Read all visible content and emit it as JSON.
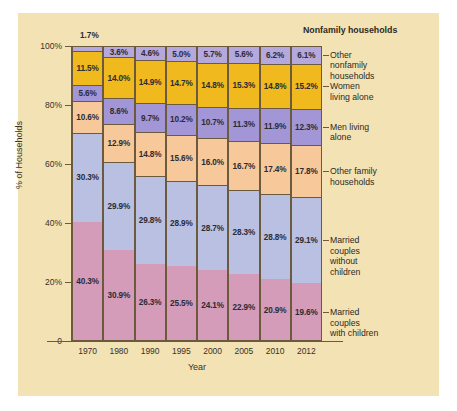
{
  "chart_data": {
    "type": "bar",
    "stacked": true,
    "title": "",
    "xlabel": "Year",
    "ylabel": "% of Households",
    "ylim": [
      0,
      100
    ],
    "ytick_labels": [
      "0",
      "20%",
      "40%",
      "60%",
      "80%",
      "100%"
    ],
    "ytick_values": [
      0,
      20,
      40,
      60,
      80,
      100
    ],
    "grid": false,
    "legend_position": "right",
    "group_header": "Nonfamily households",
    "categories": [
      "1970",
      "1980",
      "1990",
      "1995",
      "2000",
      "2005",
      "2010",
      "2012"
    ],
    "series": [
      {
        "name": "Married couples with children",
        "color": "#d49cb8",
        "values": [
          40.3,
          30.9,
          26.3,
          25.5,
          24.1,
          22.9,
          20.9,
          19.6
        ],
        "labels": [
          "40.3%",
          "30.9%",
          "26.3%",
          "25.5%",
          "24.1%",
          "22.9%",
          "20.9%",
          "19.6%"
        ]
      },
      {
        "name": "Married couples without children",
        "color": "#b9c0e2",
        "values": [
          30.3,
          29.9,
          29.8,
          28.9,
          28.7,
          28.3,
          28.8,
          29.1
        ],
        "labels": [
          "30.3%",
          "29.9%",
          "29.8%",
          "28.9%",
          "28.7%",
          "28.3%",
          "28.8%",
          "29.1%"
        ]
      },
      {
        "name": "Other family households",
        "color": "#f7c99a",
        "values": [
          10.6,
          12.9,
          14.8,
          15.6,
          16.0,
          16.7,
          17.4,
          17.8
        ],
        "labels": [
          "10.6%",
          "12.9%",
          "14.8%",
          "15.6%",
          "16.0%",
          "16.7%",
          "17.4%",
          "17.8%"
        ]
      },
      {
        "name": "Men living alone",
        "color": "#a396d6",
        "values": [
          5.6,
          8.6,
          9.7,
          10.2,
          10.7,
          11.3,
          11.9,
          12.3
        ],
        "labels": [
          "5.6%",
          "8.6%",
          "9.7%",
          "10.2%",
          "10.7%",
          "11.3%",
          "11.9%",
          "12.3%"
        ]
      },
      {
        "name": "Women living alone",
        "color": "#f0b91e",
        "values": [
          11.5,
          14.0,
          14.9,
          14.7,
          14.8,
          15.3,
          14.8,
          15.2
        ],
        "labels": [
          "11.5%",
          "14.0%",
          "14.9%",
          "14.7%",
          "14.8%",
          "15.3%",
          "14.8%",
          "15.2%"
        ]
      },
      {
        "name": "Other nonfamily households",
        "color": "#b5a8dc",
        "values": [
          1.7,
          3.6,
          4.6,
          5.0,
          5.7,
          5.6,
          6.2,
          6.1
        ],
        "labels": [
          "1.7%",
          "3.6%",
          "4.6%",
          "5.0%",
          "5.7%",
          "5.6%",
          "6.2%",
          "6.1%"
        ]
      }
    ],
    "callout": {
      "text": "1.7%",
      "refers_to": "Other nonfamily households 1970"
    }
  },
  "legend": {
    "header": "Nonfamily households",
    "entries": [
      "Other\nnonfamily\nhouseholds",
      "Women\nliving alone",
      "Men living\nalone",
      "Other family\nhouseholds",
      "Married\ncouples\nwithout\nchildren",
      "Married\ncouples\nwith children"
    ]
  },
  "colors": {
    "panel_background": "#f2e2b4",
    "axis": "#6b5a3e",
    "text": "#2f2a22"
  }
}
